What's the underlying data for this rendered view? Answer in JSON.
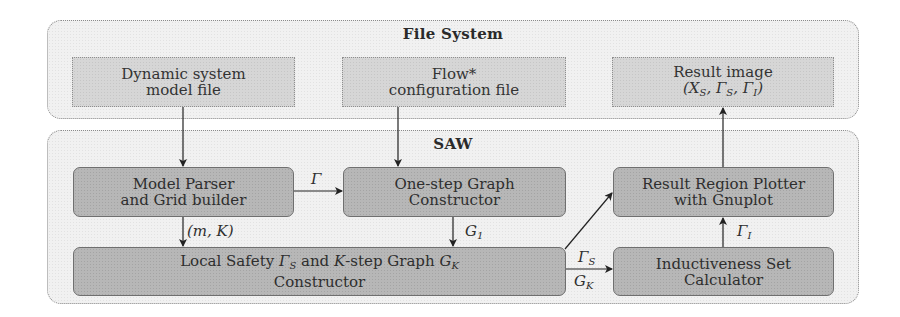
{
  "file_system": {
    "title": "File System",
    "boxes": {
      "model_file": {
        "line1": "Dynamic system",
        "line2": "model file"
      },
      "flow_config": {
        "line1": "Flow*",
        "line2": "configuration file"
      },
      "result_image": {
        "line1": "Result image",
        "line2_parts": [
          "(X",
          "S",
          ", Γ",
          "S",
          ", Γ",
          "I",
          ")"
        ]
      }
    }
  },
  "saw": {
    "title": "SAW",
    "boxes": {
      "model_parser": {
        "line1": "Model Parser",
        "line2": "and Grid builder"
      },
      "one_step": {
        "line1": "One-step Graph",
        "line2": "Constructor"
      },
      "plotter": {
        "line1": "Result Region Plotter",
        "line2": "with Gnuplot"
      },
      "local_safety": {
        "line1_parts": [
          "Local Safety ",
          "Γ",
          "S",
          " and ",
          "K",
          "-step Graph ",
          "G",
          "K"
        ],
        "line2": "Constructor"
      },
      "inductiveness": {
        "line1": "Inductiveness Set",
        "line2": "Calculator"
      }
    }
  },
  "edges": [
    {
      "from": "model_file",
      "to": "model_parser",
      "label": ""
    },
    {
      "from": "flow_config",
      "to": "one_step",
      "label": ""
    },
    {
      "from": "model_parser",
      "to": "one_step",
      "label": "Γ"
    },
    {
      "from": "model_parser",
      "to": "local_safety",
      "label": "(m, K)"
    },
    {
      "from": "one_step",
      "to": "local_safety",
      "label": "G1"
    },
    {
      "from": "local_safety",
      "to": "plotter",
      "label": ""
    },
    {
      "from": "local_safety",
      "to": "inductiveness",
      "label": "ΓS / GK"
    },
    {
      "from": "inductiveness",
      "to": "plotter",
      "label": "ΓI"
    },
    {
      "from": "plotter",
      "to": "result_image",
      "label": ""
    }
  ],
  "edge_labels": {
    "gamma": "Γ",
    "mk": "(m, K)",
    "g1_main": "G",
    "g1_sub": "1",
    "gs_main": "Γ",
    "gs_sub": "S",
    "gk_main": "G",
    "gk_sub": "K",
    "gi_main": "Γ",
    "gi_sub": "I"
  }
}
